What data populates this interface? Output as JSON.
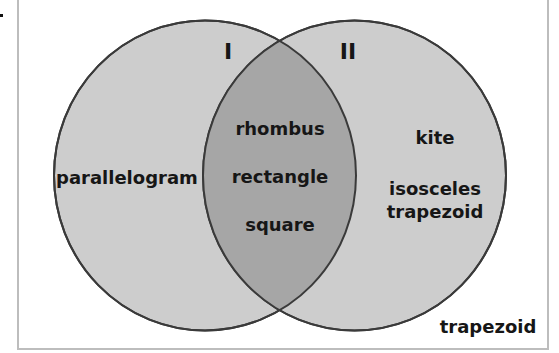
{
  "diagram": {
    "type": "venn",
    "colors": {
      "circle_fill": "#cdcdcd",
      "overlap_fill": "#a6a6a6",
      "outline": "#3a3a3a",
      "frame": "#bdbdbd"
    },
    "sets": [
      {
        "label": "I",
        "only": [
          "parallelogram"
        ]
      },
      {
        "label": "II",
        "only": [
          "kite",
          "isosceles trapezoid"
        ]
      }
    ],
    "intersection": [
      "rhombus",
      "rectangle",
      "square"
    ],
    "outside": [
      "trapezoid"
    ]
  },
  "labels": {
    "set1": "I",
    "set2": "II",
    "left_only": "parallelogram",
    "center_1": "rhombus",
    "center_2": "rectangle",
    "center_3": "square",
    "right_1": "kite",
    "right_2a": "isosceles",
    "right_2b": "trapezoid",
    "outside": "trapezoid"
  }
}
